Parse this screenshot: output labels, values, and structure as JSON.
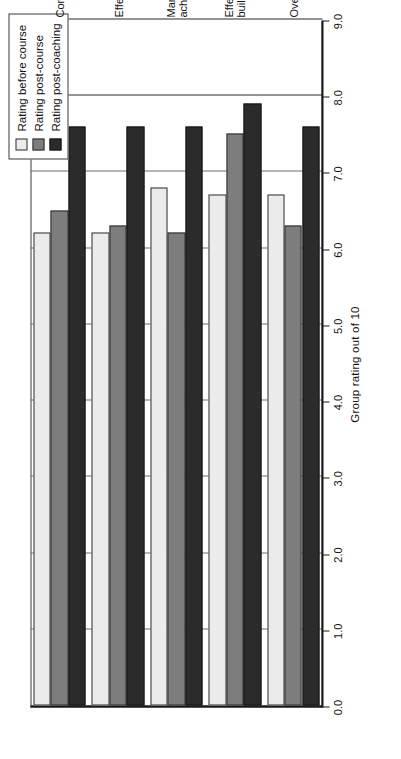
{
  "chart_data": {
    "type": "bar",
    "orientation": "horizontal",
    "title": "",
    "xlabel": "",
    "ylabel": "Group rating out of 10",
    "categories": [
      "Confidence",
      "Effectiveness",
      "Management and goal achievement",
      "Effective relationship building",
      "Overall performance"
    ],
    "category_lines": [
      [
        "Confidence"
      ],
      [
        "Effectiveness"
      ],
      [
        "Management and goal",
        "achievement"
      ],
      [
        "Effective relationship",
        "building"
      ],
      [
        "Overall performance"
      ]
    ],
    "series": [
      {
        "name": "Rating before course",
        "color": "#ebebeb",
        "values": [
          6.2,
          6.2,
          6.8,
          6.7,
          6.7
        ]
      },
      {
        "name": "Rating post-course",
        "color": "#7d7d7d",
        "values": [
          6.5,
          6.3,
          6.2,
          7.5,
          6.3
        ]
      },
      {
        "name": "Rating post-coaching",
        "color": "#2b2b2b",
        "values": [
          7.6,
          7.6,
          7.6,
          7.9,
          7.6
        ]
      }
    ],
    "ylim": [
      0.0,
      9.0
    ],
    "tick_values": [
      "0.0",
      "1.0",
      "2.0",
      "3.0",
      "4.0",
      "5.0",
      "6.0",
      "7.0",
      "8.0",
      "9.0"
    ],
    "tick_numbers": [
      0,
      1,
      2,
      3,
      4,
      5,
      6,
      7,
      8,
      9
    ],
    "grid": true,
    "legend_position": "top-left"
  },
  "legend": {
    "items": [
      {
        "label": "Rating before course",
        "swatch": "before"
      },
      {
        "label": "Rating post-course",
        "swatch": "post-course"
      },
      {
        "label": "Rating post-coaching",
        "swatch": "post-coaching"
      }
    ]
  },
  "axis": {
    "title": "Group rating out of 10"
  }
}
